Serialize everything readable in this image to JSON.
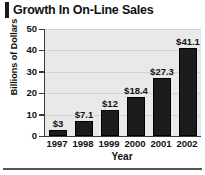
{
  "chart_data": {
    "type": "bar",
    "title": "Growth In On-Line Sales",
    "xlabel": "Year",
    "ylabel": "Billions of Dollars",
    "categories": [
      "1997",
      "1998",
      "1999",
      "2000",
      "2001",
      "2002"
    ],
    "values": [
      3,
      7.1,
      12,
      18.4,
      27.3,
      41.1
    ],
    "data_labels": [
      "$3",
      "$7.1",
      "$12",
      "$18.4",
      "$27.3",
      "$41.1"
    ],
    "ylim": [
      0,
      50
    ],
    "yticks": [
      50,
      40,
      30,
      20,
      10,
      0
    ],
    "ytick_labels": [
      "50",
      "40",
      "30",
      "20",
      "10",
      "0"
    ],
    "grid": true,
    "legend": false,
    "bar_color": "#1c1c1c",
    "plot_background": "#e9e9e9",
    "axis_color": "#3a3a3a"
  }
}
